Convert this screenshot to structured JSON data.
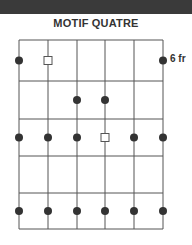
{
  "title": "MOTIF QUATRE",
  "fret_label": "6 fr",
  "colors": {
    "line": "#555555",
    "dot": "#333333",
    "topbar": "#3a3a3a"
  },
  "grid": {
    "strings_x": [
      19,
      48,
      77,
      105,
      134,
      163
    ],
    "frets_y": [
      40,
      81,
      119,
      156,
      193,
      229
    ]
  },
  "markers": [
    {
      "type": "dot",
      "string": 1,
      "row": 1
    },
    {
      "type": "square",
      "string": 2,
      "row": 1
    },
    {
      "type": "dot",
      "string": 6,
      "row": 1
    },
    {
      "type": "dot",
      "string": 3,
      "row": 2
    },
    {
      "type": "dot",
      "string": 4,
      "row": 2
    },
    {
      "type": "dot",
      "string": 1,
      "row": 3
    },
    {
      "type": "dot",
      "string": 2,
      "row": 3
    },
    {
      "type": "dot",
      "string": 3,
      "row": 3
    },
    {
      "type": "square",
      "string": 4,
      "row": 3
    },
    {
      "type": "dot",
      "string": 5,
      "row": 3
    },
    {
      "type": "dot",
      "string": 6,
      "row": 3
    },
    {
      "type": "dot",
      "string": 1,
      "row": 5
    },
    {
      "type": "dot",
      "string": 2,
      "row": 5
    },
    {
      "type": "dot",
      "string": 3,
      "row": 5
    },
    {
      "type": "dot",
      "string": 4,
      "row": 5
    },
    {
      "type": "dot",
      "string": 5,
      "row": 5
    },
    {
      "type": "dot",
      "string": 6,
      "row": 5
    }
  ]
}
